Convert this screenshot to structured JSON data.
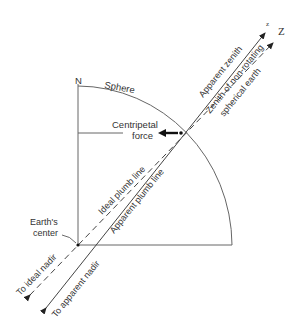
{
  "labels": {
    "north": "N",
    "sphere": "Sphere",
    "centripetal_line1": "Centripetal",
    "centripetal_line2": "force",
    "apparent_zenith": "Apparent zenith",
    "zenith_nonrot_line1": "Zenith of non-rotating",
    "zenith_nonrot_line2": "spherical earth",
    "z_small": "z",
    "z_large": "Z",
    "ideal_plumb": "Ideal plumb line",
    "apparent_plumb": "Apparent plumb line",
    "earth_center_line1": "Earth's",
    "earth_center_line2": "center",
    "to_ideal_nadir": "To ideal nadir",
    "to_apparent_nadir": "To apparent nadir"
  },
  "colors": {
    "line": "#555555",
    "text": "#333333",
    "arrow": "#111111"
  }
}
